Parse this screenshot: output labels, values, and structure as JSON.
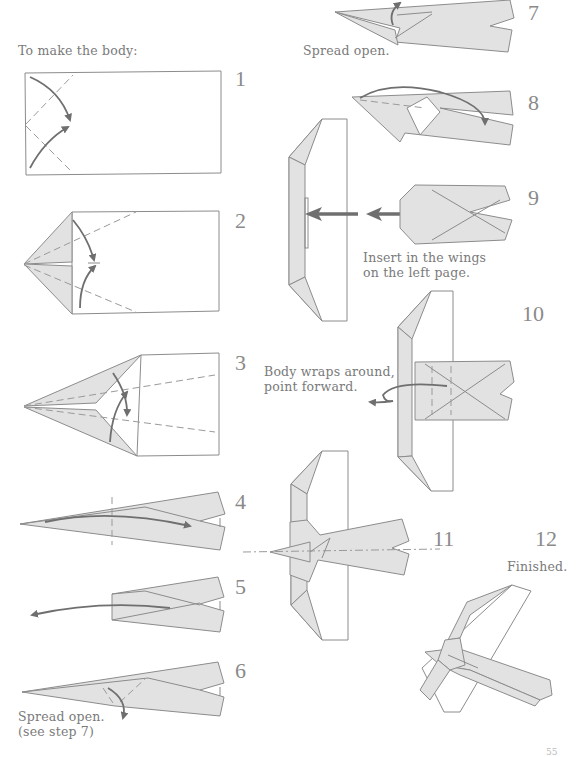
{
  "page": {
    "heading": "To make the body:",
    "page_number": "55"
  },
  "steps": [
    {
      "number": "1",
      "caption": ""
    },
    {
      "number": "2",
      "caption": ""
    },
    {
      "number": "3",
      "caption": ""
    },
    {
      "number": "4",
      "caption": ""
    },
    {
      "number": "5",
      "caption": ""
    },
    {
      "number": "6",
      "caption_line1": "Spread open.",
      "caption_line2": "(see step 7)"
    },
    {
      "number": "7",
      "caption": "Spread open."
    },
    {
      "number": "8",
      "caption": ""
    },
    {
      "number": "9",
      "caption_line1": "Insert in the wings",
      "caption_line2": "on the left page."
    },
    {
      "number": "10",
      "caption_line1": "Body wraps around,",
      "caption_line2": "point forward."
    },
    {
      "number": "11",
      "caption": ""
    },
    {
      "number": "12",
      "caption": "Finished."
    }
  ],
  "colors": {
    "paper_fill": "#e2e2e2",
    "line": "#8c8c8c",
    "arrow": "#6f6f6f",
    "text": "#7a7a7a"
  }
}
